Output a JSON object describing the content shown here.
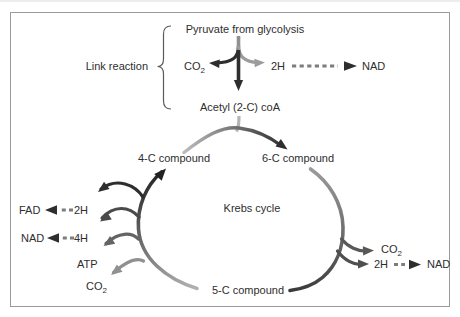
{
  "diagram": {
    "link_reaction": {
      "label": "Link reaction",
      "pyruvate_label": "Pyruvate from glycolysis",
      "co2": {
        "base": "CO",
        "sub": "2"
      },
      "h2_label": "2H",
      "nad_label": "NAD",
      "acetyl_label": "Acetyl (2-C) coA"
    },
    "cycle": {
      "label": "Krebs cycle",
      "compound4_label": "4-C compound",
      "compound6_label": "6-C compound",
      "compound5_label": "5-C compound"
    },
    "left_outputs": {
      "fad_label": "FAD",
      "h2_label": "2H",
      "nad_label": "NAD",
      "h4_label": "4H",
      "atp_label": "ATP",
      "co2": {
        "base": "CO",
        "sub": "2"
      }
    },
    "right_outputs": {
      "co2": {
        "base": "CO",
        "sub": "2"
      },
      "h2_label": "2H",
      "nad_label": "NAD"
    },
    "colors": {
      "text": "#2e2e2e",
      "dark_arrow": "#2e2e2e",
      "mid_arrow": "#5f5f5f",
      "light_arrow": "#9c9c9c",
      "dash_gray": "#7d7d7d",
      "border": "#9b9b9b",
      "background": "#ffffff"
    }
  }
}
